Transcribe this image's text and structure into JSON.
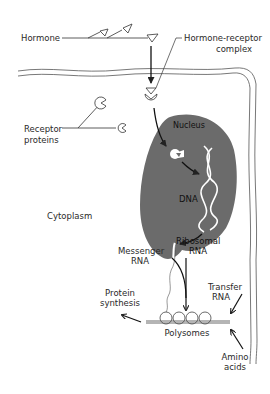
{
  "diagram": {
    "title": "",
    "labels": {
      "hormone": "Hormone",
      "hormone_receptor_complex_line1": "Hormone-receptor",
      "hormone_receptor_complex_line2": "complex",
      "receptor_proteins_line1": "Receptor",
      "receptor_proteins_line2": "proteins",
      "nucleus": "Nucleus",
      "dna": "DNA",
      "cytoplasm": "Cytoplasm",
      "messenger_rna_line1": "Messenger",
      "messenger_rna_line2": "RNA",
      "ribosomal_rna_line1": "Ribosomal",
      "ribosomal_rna_line2": "RNA",
      "protein_synthesis_line1": "Protein",
      "protein_synthesis_line2": "synthesis",
      "transfer_rna_line1": "Transfer",
      "transfer_rna_line2": "RNA",
      "polysomes": "Polysomes",
      "amino_acids_line1": "Amino",
      "amino_acids_line2": "acids"
    },
    "colors": {
      "nucleus_fill": "#6b6b6b",
      "line": "#222222",
      "background": "#ffffff"
    },
    "nodes": [
      "Hormone",
      "Hormone-receptor complex",
      "Receptor proteins",
      "Nucleus",
      "DNA",
      "Messenger RNA",
      "Ribosomal RNA",
      "Polysomes",
      "Transfer RNA",
      "Amino acids",
      "Protein synthesis",
      "Cytoplasm"
    ],
    "edges": [
      {
        "from": "Hormone",
        "to": "Hormone-receptor complex"
      },
      {
        "from": "Hormone-receptor complex",
        "to": "Nucleus"
      },
      {
        "from": "Nucleus",
        "to": "DNA"
      },
      {
        "from": "DNA",
        "to": "Messenger RNA"
      },
      {
        "from": "Messenger RNA",
        "to": "Polysomes"
      },
      {
        "from": "Ribosomal RNA",
        "to": "Polysomes"
      },
      {
        "from": "Transfer RNA",
        "to": "Polysomes"
      },
      {
        "from": "Amino acids",
        "to": "Polysomes"
      },
      {
        "from": "Polysomes",
        "to": "Protein synthesis"
      }
    ]
  }
}
